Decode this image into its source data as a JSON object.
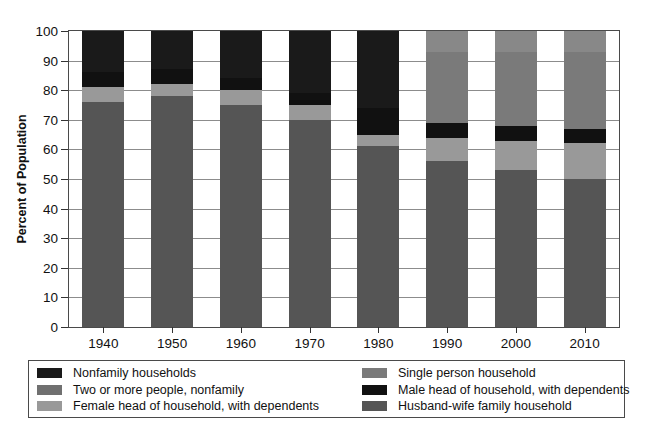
{
  "chart_data": {
    "type": "bar",
    "subtype": "stacked-100",
    "title": "",
    "xlabel": "",
    "ylabel": "Percent of Population",
    "ylim": [
      0,
      100
    ],
    "ytick_step": 10,
    "yticks": [
      "100",
      "90",
      "80",
      "70",
      "60",
      "50",
      "40",
      "30",
      "20",
      "10",
      "0"
    ],
    "grid": true,
    "legend_position": "bottom",
    "categories": [
      "1940",
      "1950",
      "1960",
      "1970",
      "1980",
      "1990",
      "2000",
      "2010"
    ],
    "series": [
      {
        "name": "Husband-wife family household",
        "color": "#555555",
        "values": [
          76,
          78,
          75,
          70,
          61,
          56,
          53,
          50
        ]
      },
      {
        "name": "Female head of household, with dependents",
        "color": "#999999",
        "values": [
          5,
          4,
          5,
          5,
          4,
          8,
          10,
          12
        ]
      },
      {
        "name": "Male head of household, with dependents",
        "color": "#111111",
        "values": [
          5,
          5,
          4,
          4,
          9,
          5,
          5,
          5
        ]
      },
      {
        "name": "Single person household",
        "color": "#7a7a7a",
        "values": [
          0,
          0,
          0,
          0,
          0,
          24,
          25,
          26
        ]
      },
      {
        "name": "Two or more people, nonfamily",
        "color": "#888888",
        "values": [
          0,
          0,
          0,
          0,
          0,
          7,
          7,
          7
        ]
      },
      {
        "name": "Nonfamily households",
        "color": "#1a1a1a",
        "values": [
          14,
          13,
          16,
          21,
          26,
          0,
          0,
          0
        ]
      }
    ]
  },
  "legend": {
    "left_column": [
      {
        "label": "Nonfamily households",
        "color": "#1a1a1a"
      },
      {
        "label": "Two or more people, nonfamily",
        "color": "#707070"
      },
      {
        "label": "Female head of household, with dependents",
        "color": "#999999"
      }
    ],
    "right_column": [
      {
        "label": "Single person household",
        "color": "#7a7a7a"
      },
      {
        "label": "Male head of household, with dependents",
        "color": "#111111"
      },
      {
        "label": "Husband-wife family household",
        "color": "#555555"
      }
    ]
  },
  "colors": {
    "axis": "#4a4a4a",
    "grid": "#8c8c8c",
    "text": "#111111",
    "background": "#ffffff"
  }
}
